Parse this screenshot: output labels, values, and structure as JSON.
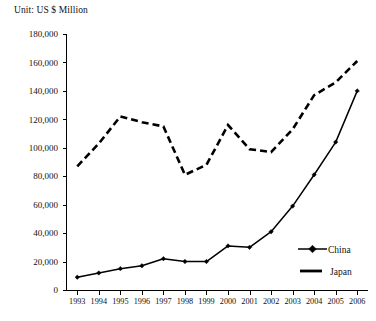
{
  "unit_label": "Unit: US $ Million",
  "legend": {
    "position": "bottom-right",
    "items": [
      {
        "label": "China",
        "style": "solid-with-diamond-marker",
        "color": "#000000"
      },
      {
        "label": "Japan",
        "style": "dashed",
        "color": "#000000"
      }
    ]
  },
  "axes": {
    "y_tick_labels": [
      "0",
      "20,000",
      "40,000",
      "60,000",
      "80,000",
      "100,000",
      "120,000",
      "140,000",
      "160,000",
      "180,000"
    ],
    "x_tick_labels": [
      "1993",
      "1994",
      "1995",
      "1996",
      "1997",
      "1998",
      "1999",
      "2000",
      "2001",
      "2002",
      "2003",
      "2004",
      "2005",
      "2006"
    ]
  },
  "chart_data": {
    "type": "line",
    "title": "",
    "subtitle": "",
    "xlabel": "",
    "ylabel": "Unit: US $ Million",
    "ylim": [
      0,
      180000
    ],
    "ytick_step": 20000,
    "grid": false,
    "legend_position": "bottom-right",
    "categories": [
      "1993",
      "1994",
      "1995",
      "1996",
      "1997",
      "1998",
      "1999",
      "2000",
      "2001",
      "2002",
      "2003",
      "2004",
      "2005",
      "2006"
    ],
    "x": [
      1993,
      1994,
      1995,
      1996,
      1997,
      1998,
      1999,
      2000,
      2001,
      2002,
      2003,
      2004,
      2005,
      2006
    ],
    "series": [
      {
        "name": "China",
        "style": "solid",
        "marker": "diamond",
        "color": "#000000",
        "values": [
          9000,
          12000,
          15000,
          17000,
          22000,
          20000,
          20000,
          31000,
          30000,
          41000,
          59000,
          81000,
          104000,
          140000
        ]
      },
      {
        "name": "Japan",
        "style": "dashed",
        "marker": "none",
        "color": "#000000",
        "values": [
          87000,
          103000,
          122000,
          118000,
          115000,
          81000,
          88000,
          116000,
          99000,
          97000,
          113000,
          137000,
          146000,
          161000
        ]
      }
    ]
  }
}
